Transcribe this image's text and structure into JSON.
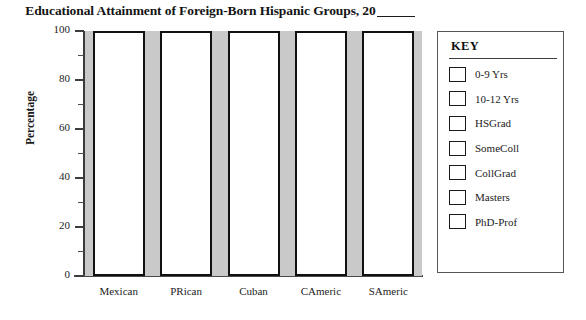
{
  "chart_data": {
    "type": "bar",
    "title": "Educational Attainment of Foreign-Born Hispanic Groups, 20",
    "title_blank_suffix": "____",
    "subtitle": "",
    "xlabel": "",
    "ylabel": "Percentage",
    "ylim": [
      0,
      100
    ],
    "ytick_labels": [
      "100",
      "80",
      "60",
      "40",
      "20",
      "0"
    ],
    "ytick_values": [
      100,
      80,
      60,
      40,
      20,
      0
    ],
    "yminor_values": [
      90,
      70,
      50,
      30,
      10
    ],
    "grid": false,
    "legend_position": "right",
    "stacked": true,
    "note": "blank worksheet template: each category bar is drawn full-height (100%) and unfilled; no segment data plotted",
    "categories": [
      "Mexican",
      "PRican",
      "Cuban",
      "CAmeric",
      "SAmeric"
    ],
    "values": [
      100,
      100,
      100,
      100,
      100
    ],
    "series": [
      {
        "name": "0-9 Yrs",
        "values": [
          0,
          0,
          0,
          0,
          0
        ]
      },
      {
        "name": "10-12 Yrs",
        "values": [
          0,
          0,
          0,
          0,
          0
        ]
      },
      {
        "name": "HSGrad",
        "values": [
          0,
          0,
          0,
          0,
          0
        ]
      },
      {
        "name": "SomeColl",
        "values": [
          0,
          0,
          0,
          0,
          0
        ]
      },
      {
        "name": "CollGrad",
        "values": [
          0,
          0,
          0,
          0,
          0
        ]
      },
      {
        "name": "Masters",
        "values": [
          0,
          0,
          0,
          0,
          0
        ]
      },
      {
        "name": "PhD-Prof",
        "values": [
          0,
          0,
          0,
          0,
          0
        ]
      }
    ]
  },
  "legend": {
    "title": "KEY",
    "items": [
      {
        "label": "0-9 Yrs"
      },
      {
        "label": "10-12 Yrs"
      },
      {
        "label": "HSGrad"
      },
      {
        "label": "SomeColl"
      },
      {
        "label": "CollGrad"
      },
      {
        "label": "Masters"
      },
      {
        "label": "PhD-Prof"
      }
    ]
  },
  "colors": {
    "bar_fill": "#ffffff",
    "bar_border": "#111111",
    "plot_background": "#c9c9c9",
    "axis": "#3d3d3d",
    "text": "#1c1c1c",
    "legend_border": "#555555"
  }
}
